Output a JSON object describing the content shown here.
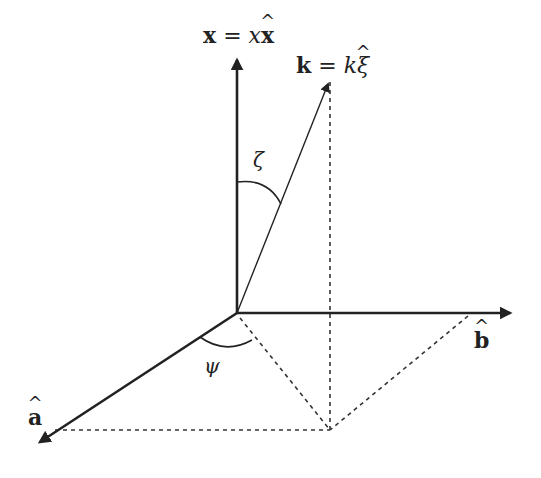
{
  "diagram": {
    "title": "",
    "background": "#ffffff",
    "line_color": "#222222",
    "origin": {
      "x": 237,
      "y": 313
    },
    "axes": [
      {
        "id": "x",
        "label": "x = xx̂",
        "label_parts": {
          "lhs": "x",
          "eq": "=",
          "coef": "x",
          "unit": "x",
          "hat": "^"
        },
        "tip": {
          "x": 237,
          "y": 55
        },
        "style": "solid-bold-arrow"
      },
      {
        "id": "b",
        "label": "b̂",
        "label_parts": {
          "unit": "b",
          "hat": "^"
        },
        "tip": {
          "x": 515,
          "y": 313
        },
        "style": "solid-bold-arrow"
      },
      {
        "id": "a",
        "label": "â",
        "label_parts": {
          "unit": "a",
          "hat": "^"
        },
        "tip": {
          "x": 35,
          "y": 445
        },
        "style": "solid-bold-arrow"
      }
    ],
    "vector_k": {
      "label": "k = kξ̂",
      "label_parts": {
        "lhs": "k",
        "eq": "=",
        "coef": "k",
        "unit": "ξ",
        "hat": "^"
      },
      "tip": {
        "x": 330,
        "y": 78
      },
      "style": "solid-thin-arrow"
    },
    "angles": [
      {
        "id": "zeta",
        "symbol": "ζ",
        "between": [
          "x",
          "k"
        ]
      },
      {
        "id": "psi",
        "symbol": "ψ",
        "between": [
          "a",
          "projection"
        ]
      }
    ],
    "projection_point": {
      "x": 330,
      "y": 430
    },
    "dashed_lines": [
      {
        "from": "k_tip",
        "to": "projection_point"
      },
      {
        "from": "origin",
        "to": "projection_point"
      },
      {
        "from": "a_axis_foot",
        "to": "projection_point"
      },
      {
        "from": "b_axis_foot",
        "to": "projection_point"
      }
    ]
  }
}
